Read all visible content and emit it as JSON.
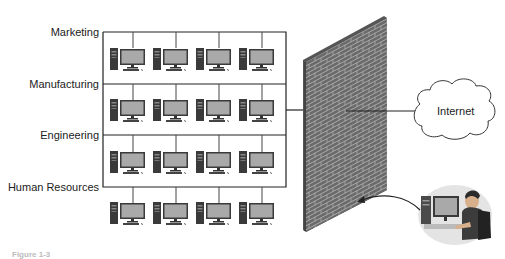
{
  "diagram": {
    "departments": [
      {
        "label": "Marketing",
        "line_y": 32
      },
      {
        "label": "Manufacturing",
        "line_y": 84
      },
      {
        "label": "Engineering",
        "line_y": 135
      },
      {
        "label": "Human Resources",
        "line_y": 187
      }
    ],
    "computers_per_department": 4,
    "firewall": {
      "icon": "brick-wall-icon"
    },
    "internet": {
      "label": "Internet",
      "icon": "cloud-icon"
    },
    "remote_user": {
      "icon": "user-at-workstation-icon"
    },
    "caption": "Figure 1-3",
    "colors": {
      "line": "#222222",
      "brick": "#6a6a6a",
      "mortar": "#a8a8a8",
      "monitor_screen": "#a9a9a9",
      "tower": "#3a3a3a"
    }
  }
}
